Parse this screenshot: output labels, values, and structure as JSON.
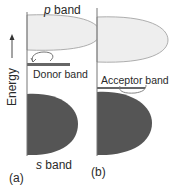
{
  "diagram": {
    "axis_label": "Energy",
    "axis_arrow": "→",
    "panels": [
      {
        "id": "a",
        "label": "(a)",
        "bands": {
          "upper": {
            "letter": "p",
            "word": "band"
          },
          "impurity": {
            "label": "Donor band"
          },
          "lower": {
            "letter": "s",
            "word": "band"
          }
        }
      },
      {
        "id": "b",
        "label": "(b)",
        "bands": {
          "impurity": {
            "label": "Acceptor band"
          }
        }
      }
    ],
    "colors": {
      "upper_band_fill": "#eeeeee",
      "upper_band_stroke": "#9a9a9a",
      "lower_band_fill": "#555555",
      "impurity_band": "#666666",
      "axis": "#777777"
    }
  }
}
